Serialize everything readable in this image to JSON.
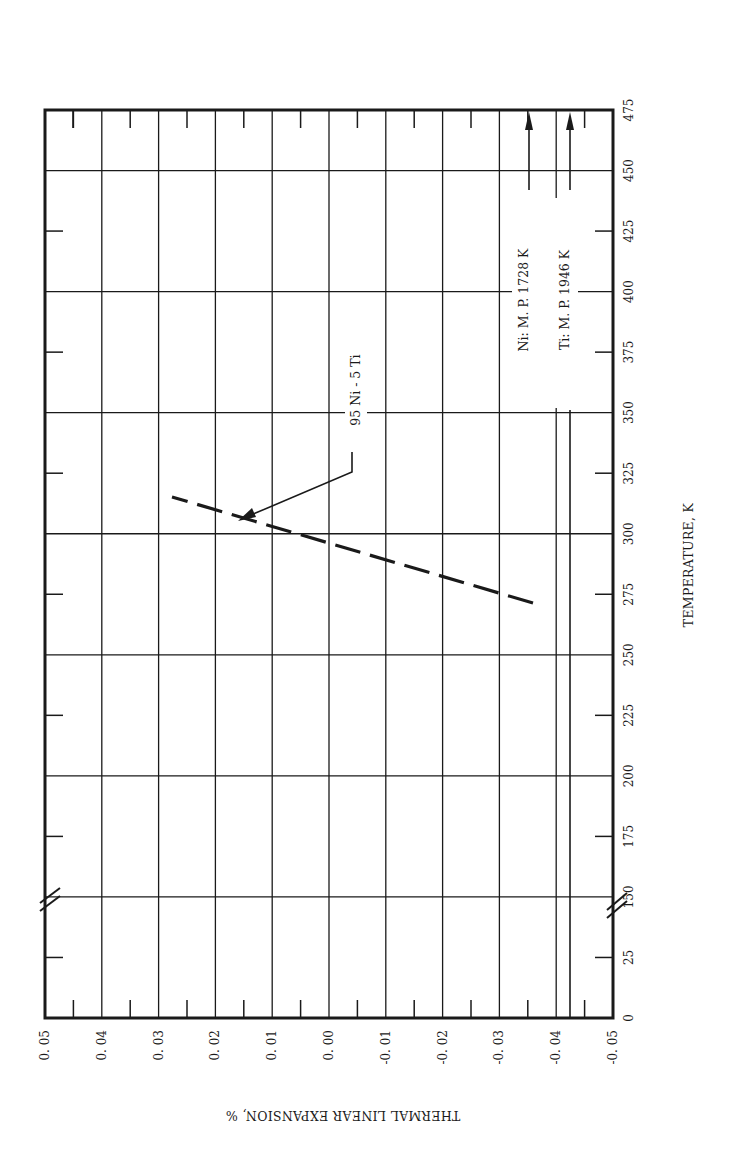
{
  "chart_data": {
    "type": "line",
    "orientation": "rotated-90-clockwise",
    "title": "",
    "xlabel": "TEMPERATURE, K",
    "ylabel": "THERMAL LINEAR EXPANSION, %",
    "x_ticks": [
      "0",
      "25",
      "150",
      "175",
      "200",
      "225",
      "250",
      "275",
      "300",
      "325",
      "350",
      "375",
      "400",
      "425",
      "450",
      "475"
    ],
    "x_axis_break": "between 25 and 150",
    "y_ticks": [
      "0. 05",
      "0. 04",
      "0. 03",
      "0. 02",
      "0. 01",
      "0. 00",
      "-0. 01",
      "-0. 02",
      "-0. 03",
      "-0. 04",
      "-0. 05"
    ],
    "ylim": [
      -0.05,
      0.05
    ],
    "grid": true,
    "series": [
      {
        "name": "95 Ni - 5 Ti",
        "style": "dashed",
        "x": [
          271,
          293,
          315
        ],
        "values": [
          -0.036,
          0.0,
          0.028
        ]
      }
    ],
    "annotations": [
      {
        "text": "95 Ni - 5 Ti",
        "points_to": "curve near 311 K"
      },
      {
        "text": "Ni:  M. P.  1728 K",
        "arrow": "up (off-scale)"
      },
      {
        "text": "Ti:  M. P.  1946 K",
        "arrow": "up (off-scale)"
      }
    ]
  },
  "labels": {
    "xlabel": "TEMPERATURE, K",
    "ylabel": "THERMAL LINEAR EXPANSION, %",
    "curve_label": "95 Ni - 5 Ti",
    "ni_mp": "Ni:  M. P.  1728 K",
    "ti_mp": "Ti:  M. P.  1946 K"
  },
  "colors": {
    "ink": "#1a1a1a",
    "paper": "#ffffff"
  }
}
